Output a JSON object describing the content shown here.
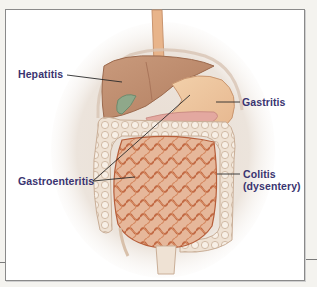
{
  "figure": {
    "type": "anatomical-illustration",
    "label_color": "#3a3470",
    "leader_color": "#2a2a2a",
    "labels": [
      {
        "id": "hepatitis",
        "text": "Hepatitis",
        "organ": "liver"
      },
      {
        "id": "gastritis",
        "text": "Gastritis",
        "organ": "stomach"
      },
      {
        "id": "gastroenteritis",
        "text": "Gastroenteritis",
        "organ": "stomach-and-small-intestine"
      },
      {
        "id": "colitis",
        "line1": "Colitis",
        "line2": "(dysentery)",
        "organ": "colon"
      }
    ]
  }
}
